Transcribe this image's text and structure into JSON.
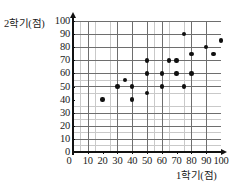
{
  "chart_data": {
    "type": "scatter",
    "title": "",
    "xlabel": "1학기(점)",
    "ylabel": "2학기(점)",
    "xlim": [
      0,
      100
    ],
    "ylim": [
      0,
      100
    ],
    "grid": true,
    "major_tick_step": 10,
    "minor_tick_step": 5,
    "legend": null,
    "xticks": [
      0,
      10,
      20,
      30,
      40,
      50,
      60,
      70,
      80,
      90,
      100
    ],
    "xticklabels": [
      "0",
      "10",
      "20",
      "30",
      "40",
      "50",
      "60",
      "70",
      "80",
      "90",
      "100"
    ],
    "yticks": [
      0,
      10,
      20,
      30,
      40,
      50,
      60,
      70,
      80,
      90,
      100
    ],
    "yticklabels": [
      "0",
      "10",
      "20",
      "30",
      "40",
      "50",
      "60",
      "70",
      "80",
      "90",
      "100"
    ],
    "points": [
      {
        "x": 20,
        "y": 40
      },
      {
        "x": 30,
        "y": 50
      },
      {
        "x": 35,
        "y": 55
      },
      {
        "x": 40,
        "y": 40
      },
      {
        "x": 40,
        "y": 50
      },
      {
        "x": 50,
        "y": 45
      },
      {
        "x": 50,
        "y": 60
      },
      {
        "x": 50,
        "y": 70
      },
      {
        "x": 60,
        "y": 50
      },
      {
        "x": 60,
        "y": 60
      },
      {
        "x": 65,
        "y": 70
      },
      {
        "x": 70,
        "y": 60
      },
      {
        "x": 70,
        "y": 70
      },
      {
        "x": 75,
        "y": 50
      },
      {
        "x": 75,
        "y": 90
      },
      {
        "x": 80,
        "y": 60
      },
      {
        "x": 80,
        "y": 75
      },
      {
        "x": 90,
        "y": 80
      },
      {
        "x": 95,
        "y": 75
      },
      {
        "x": 100,
        "y": 85
      }
    ],
    "n_points": 20,
    "marker_color": "#101010",
    "grid_minor_color": "#c9c9c9",
    "grid_major_color": "#6e6e6e",
    "axis_color": "#111111"
  }
}
